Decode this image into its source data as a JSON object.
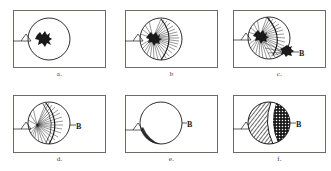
{
  "figure": {
    "background_color": "#ffffff",
    "ink_color": "#1a1a1a",
    "frame_color": "#6e6a66",
    "rows": 2,
    "columns": 3
  },
  "labels": {
    "point_a": "A",
    "point_b": "B"
  },
  "panels": [
    {
      "id": "panel-a",
      "caption": "a.",
      "row": 1,
      "column": 1,
      "has_point_a": true,
      "has_point_b": false,
      "has_fan": false,
      "has_blob_a": true,
      "has_blob_b": false,
      "fill": "none",
      "description": "Circle with a small dark irregular blob at source point A near the left interior of the circle."
    },
    {
      "id": "panel-b",
      "caption": "b",
      "row": 1,
      "column": 2,
      "has_point_a": true,
      "has_point_b": false,
      "has_fan": true,
      "has_blob_a": true,
      "has_blob_b": false,
      "fill": "fan",
      "description": "Radiating fan of rays spreads from blob at A across the left half of the circle, bounded by a curved wavefront."
    },
    {
      "id": "panel-c",
      "caption": "c.",
      "row": 1,
      "column": 3,
      "has_point_a": true,
      "has_point_b": true,
      "has_fan": true,
      "has_blob_a": true,
      "has_blob_b": true,
      "fill": "fan",
      "description": "Fan from A has converged on a second dark blob at receiver point B on the lower right of the circle."
    },
    {
      "id": "panel-d",
      "caption": "d.",
      "row": 2,
      "column": 1,
      "has_point_a": true,
      "has_point_b": true,
      "has_fan": true,
      "has_blob_a": false,
      "has_blob_b": false,
      "fill": "fan",
      "description": "Fan of rays persists from A with receiver B marked at the right edge of the circle; source blob has dispersed."
    },
    {
      "id": "panel-e",
      "caption": "e.",
      "row": 2,
      "column": 2,
      "has_point_a": true,
      "has_point_b": true,
      "has_fan": false,
      "has_blob_a": false,
      "has_blob_b": false,
      "fill": "none",
      "description": "Empty circle with only a thin shaded crescent remaining at the lower left near A and B marked at right."
    },
    {
      "id": "panel-f",
      "caption": "f.",
      "row": 2,
      "column": 3,
      "has_point_a": true,
      "has_point_b": true,
      "has_fan": false,
      "has_blob_a": false,
      "has_blob_b": false,
      "fill": "hatch-and-stipple",
      "description": "Circle fully occupied: diagonal hatching on the left lobe, dotted stipple on the right lobe, separated by a white curved band."
    }
  ]
}
